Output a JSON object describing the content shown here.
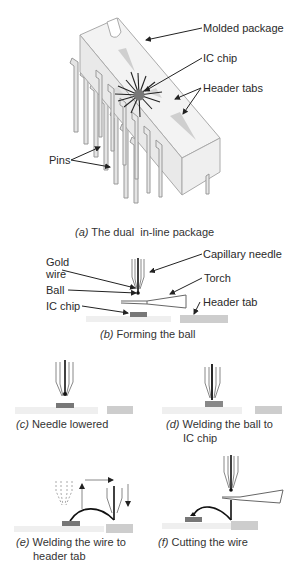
{
  "figure_a": {
    "caption_letter": "(a)",
    "caption_text": "The dual  in-line package",
    "labels": {
      "molded_package": "Molded package",
      "ic_chip": "IC chip",
      "header_tabs": "Header tabs",
      "pins": "Pins"
    }
  },
  "figure_b": {
    "caption_letter": "(b)",
    "caption_text": "Forming the ball",
    "labels": {
      "gold_wire_1": "Gold",
      "gold_wire_2": "wire",
      "capillary_needle": "Capillary needle",
      "torch": "Torch",
      "ball": "Ball",
      "header_tab": "Header tab",
      "ic_chip": "IC chip"
    }
  },
  "figure_c": {
    "caption_letter": "(c)",
    "caption_text": "Needle lowered"
  },
  "figure_d": {
    "caption_letter": "(d)",
    "caption_text_1": "Welding the ball to",
    "caption_text_2": "IC chip"
  },
  "figure_e": {
    "caption_letter": "(e)",
    "caption_text_1": "Welding the wire to",
    "caption_text_2": "header tab"
  },
  "figure_f": {
    "caption_letter": "(f)",
    "caption_text": "Cutting the wire"
  },
  "colors": {
    "line": "#222222",
    "package_fill": "#f1f1f1",
    "package_shade": "#d8d8d8",
    "chip": "#777777",
    "tab": "#c8c8c8",
    "substrate": "#ececec"
  }
}
